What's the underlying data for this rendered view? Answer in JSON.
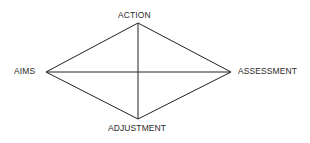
{
  "diagram": {
    "type": "diamond",
    "nodes": {
      "top": {
        "label": "ACTION",
        "x": 138,
        "y": 23
      },
      "left": {
        "label": "AIMS",
        "x": 46,
        "y": 72
      },
      "right": {
        "label": "ASSESSMENT",
        "x": 231,
        "y": 72
      },
      "bottom": {
        "label": "ADJUSTMENT",
        "x": 138,
        "y": 119
      }
    },
    "edges": [
      [
        "top",
        "right"
      ],
      [
        "right",
        "bottom"
      ],
      [
        "bottom",
        "left"
      ],
      [
        "left",
        "top"
      ],
      [
        "top",
        "bottom"
      ],
      [
        "left",
        "right"
      ]
    ],
    "line_color": "#222222",
    "text_color": "#2a2a2a"
  }
}
